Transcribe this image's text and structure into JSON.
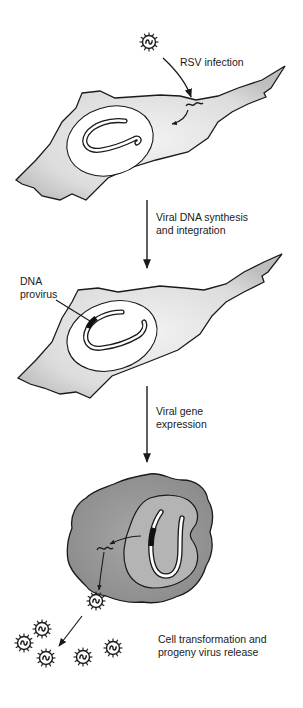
{
  "diagram": {
    "steps": [
      {
        "id": "infection",
        "label": "RSV infection"
      },
      {
        "id": "synthesis",
        "label_lines": [
          "Viral DNA synthesis",
          "and integration"
        ]
      },
      {
        "id": "expression",
        "label_lines": [
          "Viral gene",
          "expression"
        ]
      },
      {
        "id": "transformation",
        "label_lines": [
          "Cell transformation and",
          "progeny virus release"
        ]
      }
    ],
    "annotations": {
      "provirus": {
        "label_lines": [
          "DNA",
          "provirus"
        ]
      }
    },
    "elements": {
      "cells": [
        "normal-cell-infected",
        "normal-cell-with-provirus",
        "transformed-cell"
      ],
      "virus_count_released": 5
    },
    "colors": {
      "ink": "#1a1a1a",
      "cell_stipple": "#d8d8d8",
      "transformed_cell": "#9a9a9a",
      "transformed_nucleus": "#b4b4b4",
      "provirus_mark": "#111111"
    }
  }
}
